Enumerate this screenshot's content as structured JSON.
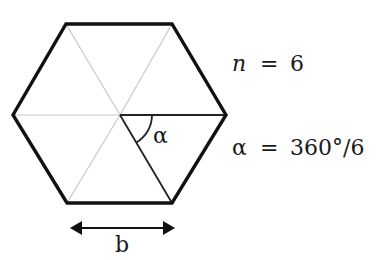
{
  "diagram": {
    "shape": "regular hexagon",
    "labels": {
      "angle_symbol": "α",
      "side_label": "b"
    },
    "equations": {
      "n_var": "n",
      "n_eq": "=",
      "n_val": "6",
      "alpha_var": "α",
      "alpha_eq": "=",
      "alpha_val": "360°/6"
    },
    "colors": {
      "outline": "#111111",
      "inner_light": "#c8c8c8",
      "inner_dark": "#222222"
    }
  }
}
